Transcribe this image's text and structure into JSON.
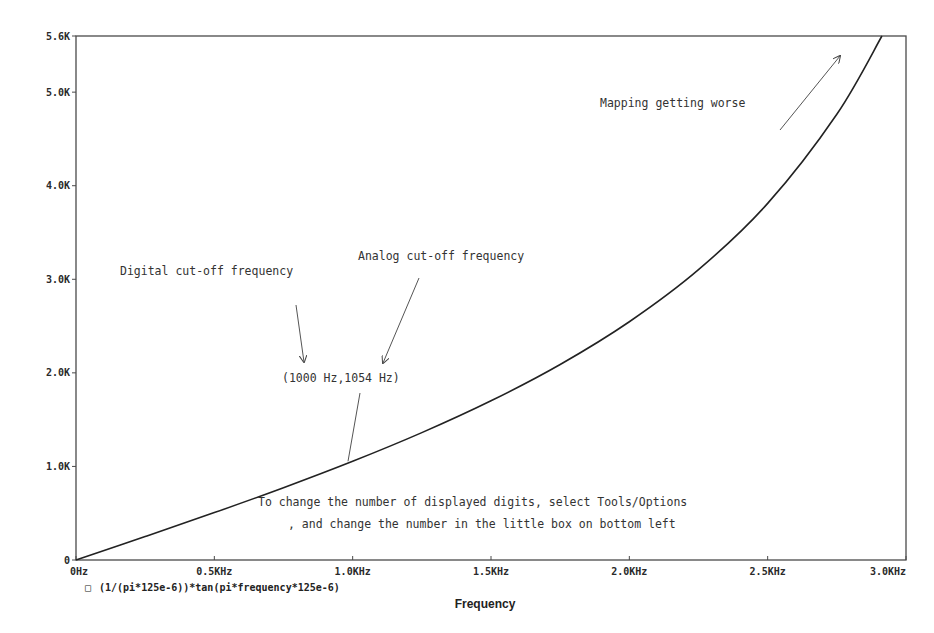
{
  "chart_data": {
    "type": "line",
    "title": "",
    "xlabel": "Frequency",
    "ylabel": "",
    "xlim": [
      0,
      3000
    ],
    "ylim": [
      0,
      5600
    ],
    "grid": false,
    "legend_position": "bottom-left",
    "x_ticks": [
      {
        "value": 0,
        "label": "0Hz"
      },
      {
        "value": 500,
        "label": "0.5KHz"
      },
      {
        "value": 1000,
        "label": "1.0KHz"
      },
      {
        "value": 1500,
        "label": "1.5KHz"
      },
      {
        "value": 2000,
        "label": "2.0KHz"
      },
      {
        "value": 2500,
        "label": "2.5KHz"
      },
      {
        "value": 3000,
        "label": "3.0KHz"
      }
    ],
    "y_ticks": [
      {
        "value": 0,
        "label": "0"
      },
      {
        "value": 1000,
        "label": "1.0K"
      },
      {
        "value": 2000,
        "label": "2.0K"
      },
      {
        "value": 3000,
        "label": "3.0K"
      },
      {
        "value": 4000,
        "label": "4.0K"
      },
      {
        "value": 5000,
        "label": "5.0K"
      },
      {
        "value": 5600,
        "label": "5.6K"
      }
    ],
    "series": [
      {
        "name": "(1/(pi*125e-6))*tan(pi*frequency*125e-6)",
        "marker": "square",
        "color": "#222222",
        "x": [
          0,
          250,
          500,
          750,
          1000,
          1250,
          1500,
          1750,
          2000,
          2250,
          2500,
          2750,
          2913
        ],
        "values": [
          0,
          250.8,
          506.5,
          772.4,
          1054.8,
          1361.1,
          1701.5,
          2089.8,
          2546.5,
          3102.9,
          3811.0,
          4764.3,
          5600
        ]
      }
    ],
    "annotations": [
      {
        "text": "Mapping getting worse",
        "x": 2200,
        "y": 5100
      },
      {
        "text": "Digital cut-off frequency",
        "x": 150,
        "y": 3100
      },
      {
        "text": "Analog cut-off frequency",
        "x": 1020,
        "y": 2250
      },
      {
        "text": "(1000 Hz,1054 Hz)",
        "x": 750,
        "y": 1900
      },
      {
        "text": "To change the number of displayed digits, select Tools/Options",
        "x": 650,
        "y": 750
      },
      {
        "text": ", and change the number in the little box on bottom left",
        "x": 770,
        "y": 500
      }
    ]
  },
  "legend": {
    "marker": "□",
    "label": "(1/(pi*125e-6))*tan(pi*frequency*125e-6)"
  }
}
